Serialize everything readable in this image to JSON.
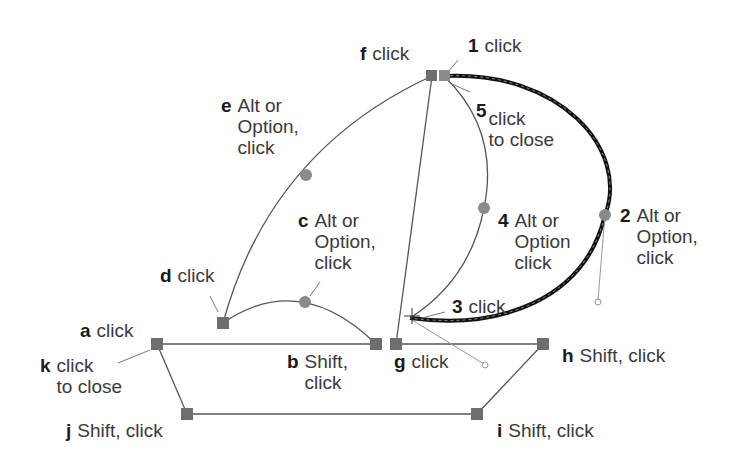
{
  "diagram": {
    "colors": {
      "anchor": "#6e6e6e",
      "control_point": "#8a8a8a",
      "thin_path": "#555555",
      "active_path": "#111111",
      "label_text": "#3a3a3a",
      "label_key": "#1a1a1a"
    },
    "labels": [
      {
        "key": "a",
        "text": "click"
      },
      {
        "key": "b",
        "text": "Shift,\nclick"
      },
      {
        "key": "c",
        "text": "Alt or\nOption,\nclick"
      },
      {
        "key": "d",
        "text": "click"
      },
      {
        "key": "e",
        "text": "Alt or\nOption,\nclick"
      },
      {
        "key": "f",
        "text": "click"
      },
      {
        "key": "g",
        "text": "click"
      },
      {
        "key": "h",
        "text": "Shift, click"
      },
      {
        "key": "i",
        "text": "Shift, click"
      },
      {
        "key": "j",
        "text": "Shift, click"
      },
      {
        "key": "k",
        "text": "click\nto close"
      },
      {
        "key": "1",
        "text": "click"
      },
      {
        "key": "2",
        "text": "Alt or\nOption,\nclick"
      },
      {
        "key": "3",
        "text": "click"
      },
      {
        "key": "4",
        "text": "Alt or\nOption\nclick"
      },
      {
        "key": "5",
        "text": "click\nto close"
      }
    ]
  }
}
